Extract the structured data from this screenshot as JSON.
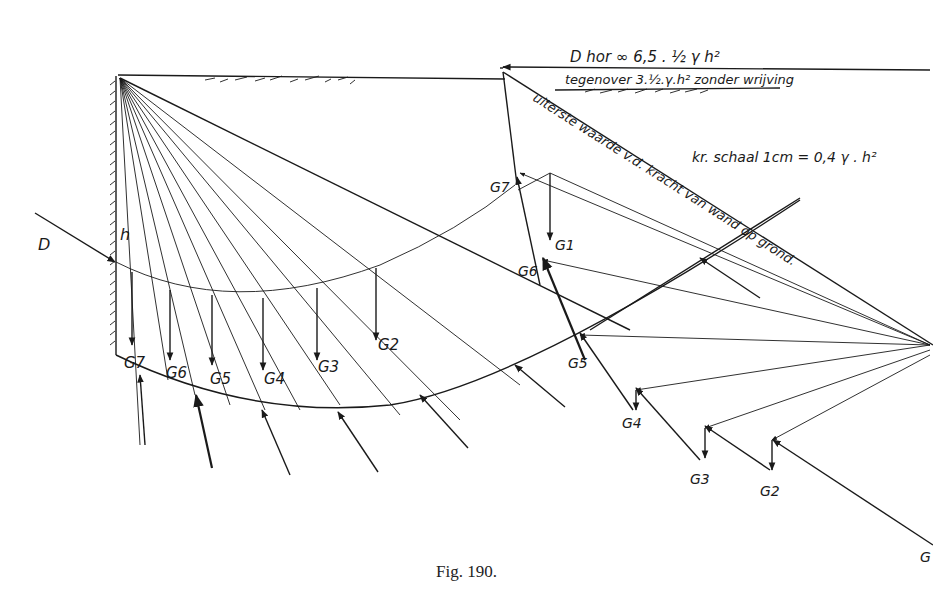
{
  "figure": {
    "caption": "Fig. 190.",
    "colors": {
      "ink": "#1a1a1a",
      "paper": "#ffffff"
    }
  },
  "labels": {
    "D": "D",
    "h": "h",
    "annotation_line1": "D hor ∞ 6,5 . ½ γ h²",
    "annotation_line2": "tegenover 3.½.γ.h² zonder wrijving",
    "diagonal_text": "uiterste waarde v.d. kracht van wand op grond.",
    "scale": "kr. schaal 1cm = 0,4 γ . h²"
  },
  "left_loads": [
    "G7",
    "G6",
    "G5",
    "G4",
    "G3",
    "G2"
  ],
  "polygon_loads": {
    "G7": "G7",
    "G1": "G1",
    "G6": "G6",
    "G5": "G5",
    "G4": "G4",
    "G3": "G3",
    "G2": "G2",
    "G_edge": "G"
  }
}
